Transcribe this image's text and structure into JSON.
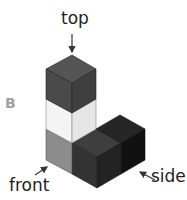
{
  "diagram": {
    "panel_label": "B",
    "labels": {
      "top": "top",
      "front": "front",
      "side": "side"
    },
    "cubes": [
      {
        "position": "column-top",
        "color": "#4a4a4a"
      },
      {
        "position": "column-middle",
        "color": "#f2f2f2"
      },
      {
        "position": "column-bottom",
        "color": "#8c8c8c"
      },
      {
        "position": "row-front",
        "color": "#2e2e2e"
      },
      {
        "position": "row-back",
        "color": "#1a1a1a"
      }
    ],
    "colors": {
      "text": "#222222",
      "panel_label": "#a0a0a0",
      "arrow": "#333333",
      "edge": "#555555"
    }
  }
}
